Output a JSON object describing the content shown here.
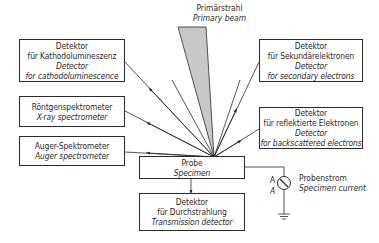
{
  "diagram": {
    "type": "block-diagram",
    "primary_beam": {
      "de": "Primärstrahl",
      "en": "Primary beam",
      "fill": "#c8c8c8"
    },
    "specimen": {
      "de": "Probe",
      "en": "Specimen"
    },
    "detectors": [
      {
        "id": "cathodoluminescence",
        "de_1": "Detektor",
        "de_2": "für Kathodolumineszenz",
        "en_1": "Detector",
        "en_2": "for cathodoluminescence",
        "side": "left"
      },
      {
        "id": "xray",
        "de_1": "Röntgenspektrometer",
        "en_1": "X-ray spectrometer",
        "side": "left"
      },
      {
        "id": "auger",
        "de_1": "Auger-Spektrometer",
        "en_1": "Auger spectrometer",
        "side": "left"
      },
      {
        "id": "secondary",
        "de_1": "Detektor",
        "de_2": "für Sekundärelektronen",
        "en_1": "Detector",
        "en_2": "for secondary electrons",
        "side": "right"
      },
      {
        "id": "backscattered",
        "de_1": "Detektor",
        "de_2": "für reflektierte Elektronen",
        "en_1": "Detector",
        "en_2": "for backscattered electrons",
        "side": "right"
      },
      {
        "id": "transmission",
        "de_1": "Detektor",
        "de_2": "für Durchstrahlung",
        "en_1": "Transmission detector",
        "side": "bottom"
      }
    ],
    "specimen_current": {
      "meter_label_1": "A",
      "meter_label_2": "A",
      "de": "Probenstrom",
      "en": "Specimen current"
    },
    "colors": {
      "line": "#2a2a2a",
      "beam": "#c8c8c8",
      "background": "#ffffff"
    }
  }
}
